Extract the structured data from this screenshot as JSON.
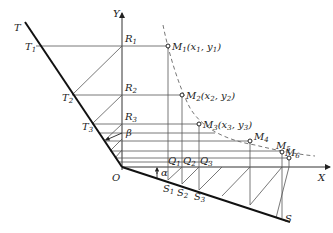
{
  "diagram": {
    "axes": {
      "x_label": "X",
      "y_label": "Y",
      "origin_label": "O"
    },
    "lines": {
      "upper_line_label": "T",
      "lower_line_label": "S"
    },
    "angles": {
      "alpha": "α",
      "beta": "β"
    },
    "t_points": [
      {
        "name": "T",
        "sub": "1"
      },
      {
        "name": "T",
        "sub": "2"
      },
      {
        "name": "T",
        "sub": "3"
      }
    ],
    "r_points": [
      {
        "name": "R",
        "sub": "1"
      },
      {
        "name": "R",
        "sub": "2"
      },
      {
        "name": "R",
        "sub": "3"
      }
    ],
    "s_points": [
      {
        "name": "S",
        "sub": "1"
      },
      {
        "name": "S",
        "sub": "2"
      },
      {
        "name": "S",
        "sub": "3"
      }
    ],
    "q_points": [
      {
        "name": "Q",
        "sub": "1"
      },
      {
        "name": "Q",
        "sub": "2"
      },
      {
        "name": "Q",
        "sub": "3"
      }
    ],
    "m_points": [
      {
        "name": "M",
        "sub": "1",
        "coords": "(x",
        "csub": "1",
        "mid": ", y",
        "csub2": "1",
        "end": ")"
      },
      {
        "name": "M",
        "sub": "2",
        "coords": "(x",
        "csub": "2",
        "mid": ", y",
        "csub2": "2",
        "end": ")"
      },
      {
        "name": "M",
        "sub": "3",
        "coords": "(x",
        "csub": "3",
        "mid": ", y",
        "csub2": "3",
        "end": ")"
      },
      {
        "name": "M",
        "sub": "4"
      },
      {
        "name": "M",
        "sub": "5"
      },
      {
        "name": "M",
        "sub": "6"
      }
    ]
  }
}
